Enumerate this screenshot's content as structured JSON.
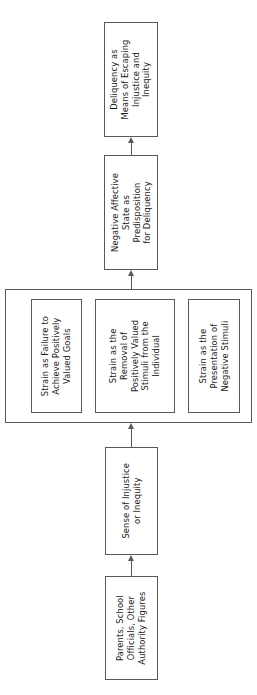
{
  "diagram": {
    "type": "flowchart",
    "orientation": "rotated-90-ccw",
    "flow_direction": "bottom-to-top",
    "colors": {
      "background": "#ffffff",
      "box_border": "#58595b",
      "box_fill": "#ffffff",
      "text": "#1a1a1a",
      "connector": "#58595b"
    },
    "nodes": {
      "delinquency": {
        "label": "Deliquency as Means of Escaping Injustice and Inequity",
        "lines": [
          "Deliquency as",
          "Means of Escaping",
          "Injustice and",
          "Inequity"
        ]
      },
      "negative_affect": {
        "label": "Negative Affective State as Predisposition for Deliquency",
        "lines": [
          "Negative Affective",
          "State as",
          "Predisposition",
          "for Deliquency"
        ]
      },
      "strain_failure": {
        "label": "Strain as Failure to Achieve Positively Valued Goals",
        "lines": [
          "Strain as Failure to",
          "Achieve Positively",
          "Valued Goals"
        ]
      },
      "strain_removal": {
        "label": "Strain as the Removal of Positively Valued Stimuli from the Individual",
        "lines": [
          "Strain as the",
          "Removal of",
          "Positively Valued",
          "Stimuli from the",
          "Individual"
        ]
      },
      "strain_negative": {
        "label": "Strain as the Presentation of Negative Stimuli",
        "lines": [
          "Strain as the",
          "Presentation of",
          "Negative Stimuli"
        ]
      },
      "injustice": {
        "label": "Sense of Injustice or Inequity",
        "lines": [
          "Sense of Injustice",
          "or Inequity"
        ]
      },
      "authority": {
        "label": "Parents, School Officials, Other Authority Figures",
        "lines": [
          "Parents, School",
          "Officials, Other",
          "Authority Figures"
        ]
      }
    },
    "edges": [
      {
        "from": "authority",
        "to": "injustice",
        "arrow": "up"
      },
      {
        "from": "injustice",
        "to": "strain_group",
        "arrow": "up"
      },
      {
        "from": "strain_group",
        "to": "negative_affect",
        "arrow": "up"
      },
      {
        "from": "negative_affect",
        "to": "delinquency",
        "arrow": "up"
      }
    ]
  }
}
